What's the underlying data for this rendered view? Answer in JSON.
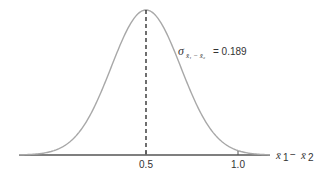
{
  "chart_data": {
    "type": "line",
    "title": "",
    "distribution": "normal",
    "mean": 0.5,
    "std_dev": 0.189,
    "xlabel": "x̄1 − x̄2",
    "ylabel": "",
    "x_ticks": [
      0.5,
      1.0
    ],
    "x_tick_labels": [
      "0.5",
      "1.0"
    ],
    "xlim": [
      -0.16,
      1.2
    ],
    "grid": false,
    "legend": null,
    "annotations": [
      {
        "text": "σ x̄1 − x̄2 = 0.189",
        "position": "right of peak"
      },
      {
        "text": "dashed vertical line at mean 0.5"
      }
    ],
    "colors": {
      "curve": "#a8a8a8",
      "axis": "#555555",
      "mean_line": "#222222"
    }
  },
  "labels": {
    "tick_0": "0.5",
    "tick_1": "1.0",
    "sigma_symbol": "σ",
    "sigma_sub": "x̄₁ − x̄₂",
    "sigma_value": "= 0.189",
    "axis_x1": "x̄",
    "axis_sub1": "1",
    "axis_minus": "−",
    "axis_x2": "x̄",
    "axis_sub2": "2"
  }
}
